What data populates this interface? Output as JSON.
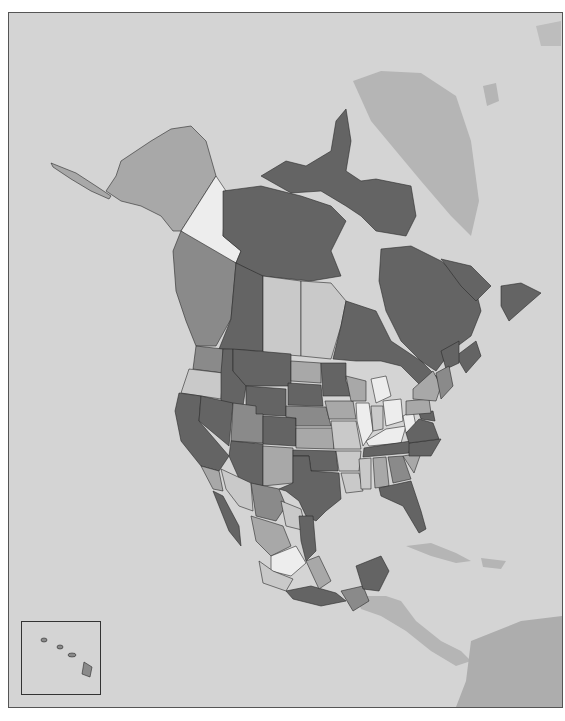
{
  "map": {
    "type": "choropleth",
    "region": "North America",
    "colors": {
      "ocean": "#d4d4d4",
      "non_data_land": "#b5b5b5",
      "frame_border": "#555555",
      "shade_1": "#ededed",
      "shade_2": "#c9c9c9",
      "shade_3": "#a8a8a8",
      "shade_4": "#8a8a8a",
      "shade_5": "#646464"
    },
    "inset": {
      "label": "Hawaii inset"
    }
  }
}
